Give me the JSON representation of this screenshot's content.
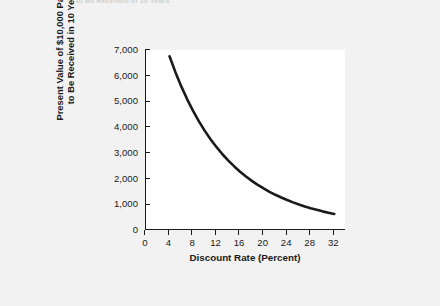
{
  "page": {
    "background_color": "#f2f2f2",
    "caption_tail": "to Be Received in 10 Years"
  },
  "chart_data": {
    "type": "line",
    "title": "",
    "xlabel": "Discount Rate (Percent)",
    "ylabel": "Present Value of $10,000 Payment\nto Be Received in 10 Years",
    "xlim": [
      0,
      34
    ],
    "ylim": [
      0,
      7000
    ],
    "xticks": [
      0,
      4,
      8,
      12,
      16,
      20,
      24,
      28,
      32
    ],
    "xtick_labels": [
      "0",
      "4",
      "8",
      "12",
      "16",
      "20",
      "24",
      "28",
      "32"
    ],
    "yticks": [
      0,
      1000,
      2000,
      3000,
      4000,
      5000,
      6000,
      7000
    ],
    "ytick_labels": [
      "0",
      "1,000",
      "2,000",
      "3,000",
      "4,000",
      "5,000",
      "6,000",
      "7,000"
    ],
    "grid": false,
    "legend": null,
    "line_color": "#1a1a1a",
    "line_width": 2.6,
    "x": [
      4,
      5,
      6,
      7,
      8,
      9,
      10,
      11,
      12,
      13,
      14,
      15,
      16,
      17,
      18,
      19,
      20,
      21,
      22,
      23,
      24,
      25,
      26,
      27,
      28,
      29,
      30,
      31,
      32
    ],
    "y": [
      6756,
      6139,
      5584,
      5083,
      4632,
      4224,
      3855,
      3522,
      3220,
      2946,
      2697,
      2472,
      2267,
      2080,
      1911,
      1756,
      1615,
      1486,
      1369,
      1262,
      1164,
      1074,
      992,
      916,
      847,
      784,
      725,
      672,
      623
    ],
    "series": [
      {
        "name": "Present Value of $10,000 Payment to Be Received in 10 Years",
        "values": [
          6756,
          6139,
          5584,
          5083,
          4632,
          4224,
          3855,
          3522,
          3220,
          2946,
          2697,
          2472,
          2267,
          2080,
          1911,
          1756,
          1615,
          1486,
          1369,
          1262,
          1164,
          1074,
          992,
          916,
          847,
          784,
          725,
          672,
          623
        ]
      }
    ]
  }
}
